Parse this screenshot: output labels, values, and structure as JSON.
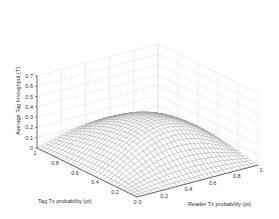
{
  "chart_data": {
    "type": "surface3d",
    "title": "",
    "xlabel": "Reader Tx probability (pt)",
    "ylabel": "Tag Tx probability (pt)",
    "zlabel": "Average Tag throughput (T)",
    "x_ticks": [
      "0",
      "0.2",
      "0.4",
      "0.6",
      "0.8",
      "1"
    ],
    "y_ticks": [
      "0",
      "0.2",
      "0.4",
      "0.6",
      "0.8",
      "1"
    ],
    "z_ticks": [
      "0",
      "0.1",
      "0.2",
      "0.3",
      "0.4",
      "0.5",
      "0.6",
      "0.7"
    ],
    "xlim": [
      0,
      1
    ],
    "ylim": [
      0,
      1
    ],
    "zlim": [
      0,
      0.7
    ],
    "grid": true,
    "legend": null,
    "surface_description": "Mesh surface rising from ~0 at the axes edges to a broad hump with peak ~0.30 near pt≈0.5, pr≈0.5; drops toward 0 at pt=0 and pr=0 and toward low values at pt=1/pr=1 edges",
    "sample_points": [
      {
        "tag": 0.0,
        "reader": 0.0,
        "T": 0.0
      },
      {
        "tag": 0.5,
        "reader": 0.5,
        "T": 0.3
      },
      {
        "tag": 1.0,
        "reader": 0.5,
        "T": 0.12
      },
      {
        "tag": 0.5,
        "reader": 1.0,
        "T": 0.1
      },
      {
        "tag": 1.0,
        "reader": 1.0,
        "T": 0.02
      },
      {
        "tag": 0.2,
        "reader": 0.8,
        "T": 0.18
      }
    ]
  }
}
